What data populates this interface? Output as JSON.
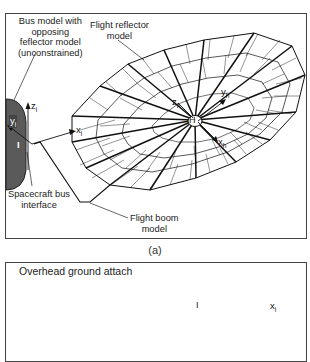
{
  "figure_a": {
    "caption": "(a)",
    "labels": {
      "bus_model_line1": "Bus model with",
      "bus_model_line2": "opposing",
      "bus_model_line3": "feflector model",
      "bus_model_line4": "(unconstrained)",
      "flight_reflector_line1": "Flight reflector",
      "flight_reflector_line2": "model",
      "spacecraft_bus_line1": "Spacecraft bus",
      "spacecraft_bus_line2": "interface",
      "flight_boom_line1": "Flight boom",
      "flight_boom_line2": "model"
    },
    "axes": {
      "z_i": "z",
      "z_i_sub": "i",
      "y_i": "y",
      "y_i_sub": "l",
      "x_i": "x",
      "x_i_sub": "i",
      "I_marker": "I",
      "z_h": "z",
      "z_h_sub": "h",
      "y_h": "y",
      "y_h_sub": "h",
      "x_h": "x",
      "x_h_sub": "h",
      "H_marker": "H"
    },
    "colors": {
      "bus_fill": "#5a5a5a",
      "line": "#111111"
    }
  },
  "figure_b": {
    "labels": {
      "overhead_attach": "Overhead ground attach"
    },
    "axes": {
      "x_i": "x",
      "x_i_sub": "i",
      "I_marker": "I"
    }
  }
}
